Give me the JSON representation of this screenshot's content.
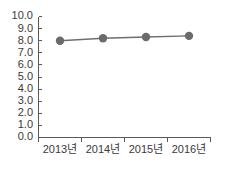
{
  "chart_data": {
    "type": "line",
    "title": "",
    "subtitle": "",
    "xlabel": "",
    "ylabel": "",
    "categories": [
      "2013년",
      "2014년",
      "2015년",
      "2016년"
    ],
    "values": [
      8.0,
      8.2,
      8.3,
      8.4
    ],
    "series": [
      {
        "name": "",
        "values": [
          8.0,
          8.2,
          8.3,
          8.4
        ]
      }
    ],
    "ylim": [
      0.0,
      10.0
    ],
    "ytick_step": 1.0,
    "ytick_labels": [
      "0.0",
      "1.0",
      "2.0",
      "3.0",
      "4.0",
      "5.0",
      "6.0",
      "7.0",
      "8.0",
      "9.0",
      "10.0"
    ],
    "ytick_values": [
      0.0,
      1.0,
      2.0,
      3.0,
      4.0,
      5.0,
      6.0,
      7.0,
      8.0,
      9.0,
      10.0
    ],
    "grid": false,
    "legend": false,
    "legend_position": "none",
    "annotations": [],
    "colors": {
      "line": "#6e6e6e",
      "marker": "#6b6b6b",
      "axis": "#5a5a5a",
      "tick_label": "#3a3a3a",
      "background": "#ffffff"
    },
    "marker": "circle",
    "marker_size": 4.2,
    "line_width": 1.4
  }
}
